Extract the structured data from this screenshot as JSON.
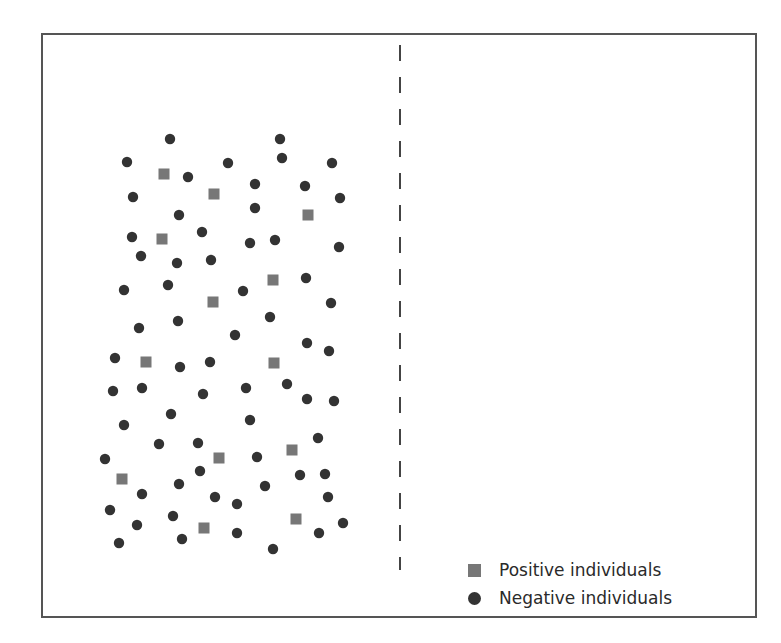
{
  "colors": {
    "positive": "#777777",
    "negative": "#333333",
    "frame": "#555555",
    "divider": "#444444"
  },
  "legend": {
    "items": [
      {
        "label": "Positive individuals",
        "shape": "square",
        "color": "#777777"
      },
      {
        "label": "Negative individuals",
        "shape": "circle",
        "color": "#333333"
      }
    ]
  },
  "chart_data": {
    "type": "scatter",
    "title": "",
    "xlabel": "",
    "ylabel": "",
    "legend_position": "bottom-right",
    "grid": false,
    "divider": {
      "style": "dashed",
      "orientation": "vertical",
      "x": 400,
      "y_range": [
        45,
        570
      ]
    },
    "series": [
      {
        "name": "Positive individuals",
        "marker": "square",
        "points": [
          [
            164,
            174
          ],
          [
            214,
            194
          ],
          [
            162,
            239
          ],
          [
            308,
            215
          ],
          [
            213,
            302
          ],
          [
            273,
            280
          ],
          [
            146,
            362
          ],
          [
            274,
            363
          ],
          [
            219,
            458
          ],
          [
            292,
            450
          ],
          [
            122,
            479
          ],
          [
            204,
            528
          ],
          [
            296,
            519
          ]
        ]
      },
      {
        "name": "Negative individuals",
        "marker": "circle",
        "points": [
          [
            170,
            139
          ],
          [
            280,
            139
          ],
          [
            282,
            158
          ],
          [
            127,
            162
          ],
          [
            228,
            163
          ],
          [
            332,
            163
          ],
          [
            188,
            177
          ],
          [
            255,
            184
          ],
          [
            305,
            186
          ],
          [
            133,
            197
          ],
          [
            340,
            198
          ],
          [
            255,
            208
          ],
          [
            179,
            215
          ],
          [
            202,
            232
          ],
          [
            132,
            237
          ],
          [
            275,
            240
          ],
          [
            250,
            243
          ],
          [
            339,
            247
          ],
          [
            141,
            256
          ],
          [
            211,
            260
          ],
          [
            177,
            263
          ],
          [
            306,
            278
          ],
          [
            168,
            285
          ],
          [
            124,
            290
          ],
          [
            243,
            291
          ],
          [
            331,
            303
          ],
          [
            270,
            317
          ],
          [
            178,
            321
          ],
          [
            139,
            328
          ],
          [
            235,
            335
          ],
          [
            307,
            343
          ],
          [
            329,
            351
          ],
          [
            115,
            358
          ],
          [
            210,
            362
          ],
          [
            180,
            367
          ],
          [
            287,
            384
          ],
          [
            142,
            388
          ],
          [
            246,
            388
          ],
          [
            113,
            391
          ],
          [
            203,
            394
          ],
          [
            307,
            399
          ],
          [
            334,
            401
          ],
          [
            171,
            414
          ],
          [
            250,
            420
          ],
          [
            124,
            425
          ],
          [
            318,
            438
          ],
          [
            198,
            443
          ],
          [
            159,
            444
          ],
          [
            257,
            457
          ],
          [
            105,
            459
          ],
          [
            200,
            471
          ],
          [
            325,
            474
          ],
          [
            300,
            475
          ],
          [
            179,
            484
          ],
          [
            265,
            486
          ],
          [
            142,
            494
          ],
          [
            215,
            497
          ],
          [
            328,
            497
          ],
          [
            237,
            504
          ],
          [
            110,
            510
          ],
          [
            173,
            516
          ],
          [
            343,
            523
          ],
          [
            137,
            525
          ],
          [
            237,
            533
          ],
          [
            319,
            533
          ],
          [
            182,
            539
          ],
          [
            119,
            543
          ],
          [
            273,
            549
          ]
        ]
      }
    ]
  }
}
